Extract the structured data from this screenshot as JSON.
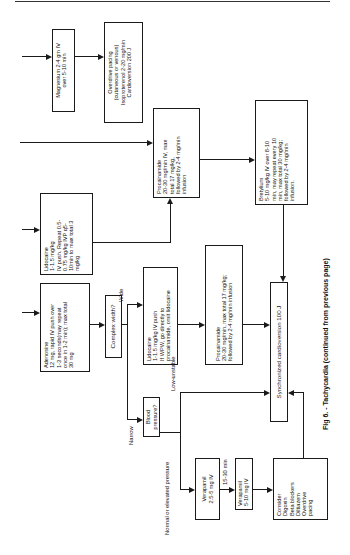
{
  "figure": {
    "caption": "Fig 6. - Tachycardia (continued from previous page)"
  },
  "boxes": {
    "magnesium": "Magnesium 2-4 gm IV\nover 5-10 min",
    "overdrive": "Overdrive pacing\n(cutaneous or venous)\nIsoproterenol 2-20 mg/min\nCardioversion 200 J",
    "procainamide_top": "Procainamide\n20-30 mg/min IV, max\ntotal 17 mg/kg,\nfollowed by 2-4 mg/min\ninfusion",
    "bretylium": "Bretylium\n5-10 mg/kg IV over 8-10\nmin, may repeat every 10\nmin, max total 30 mg/kg;\nfollowed by 2-4 mg/min\ninfusion.",
    "lidocaine_top": "Lidocaine\n1-1.5 mg/kg\nIV push. Repeat 0.5-\n0.75 mg/kg IVP q5-\n10min to max total 3\nmg/kg",
    "adenosine": "Adenosine\n12 mg, rapid IV push over\n1-3 seconds(may repeat\nonce in 1-2 min); max total\n30 mg",
    "complex_width": "Complex width?",
    "lidocaine_mid": "Lidocaine\n1-1.5 mg/kg IV push\nIf WPW, go directly to\nprocainamide, omit lidocaine",
    "procainamide_mid": "Procainamide\n20-30 mg/min, max total 17 mg/kg;\nfollowed by 2-4 mg/min infusion",
    "synchronized": "Synchronized cardioversion 100 J",
    "blood_pressure": "Blood pressure?",
    "verapamil_1": "Verapamil\n2.5-5 mg IV",
    "verapamil_2": "Verapamil\n5-10 mg IV",
    "consider": "Consider\nDigoxin\nBeta blockers\nDiltiazem\nOverdrive\npacing"
  },
  "labels": {
    "wide": "Wide",
    "narrow": "Narrow",
    "low_unstable": "Low-unstable",
    "normal_elevated": "Normal or elevated pressure",
    "interval": "15-30 min"
  }
}
